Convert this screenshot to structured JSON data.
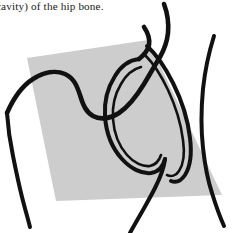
{
  "figure": {
    "caption_fragment": "cavity) of the hip bone."
  },
  "colors": {
    "background": "#ffffff",
    "plane_fill": "#cdcdcd",
    "ink": "#111111",
    "caption_text": "#1a1a1a"
  },
  "plane": {
    "name": "sectional-plane-parallelogram",
    "points": "27,58 148,40 222,195 56,201"
  },
  "strokes": {
    "iliac_crest": {
      "name": "iliac-crest-outline",
      "d": "M 7,113 C 14,97 22,86 33,79 C 44,72 56,70 65,74 C 74,78 77,86 80,95 C 83,105 86,112 93,116 C 100,120 110,119 119,113 C 128,107 136,97 144,84 C 150,74 155,65 160,57 C 164,50 167,42 168,33 C 169,22 167,12 164,4",
      "width": 4.6
    },
    "ischium_lower": {
      "name": "ischium-inferior-ramus",
      "d": "M 7,113 C 8,128 10,142 13,156 C 16,171 19,185 22,197 C 25,209 28,219 30,227",
      "width": 4.0
    },
    "acetabulum_outer": {
      "name": "acetabulum-outer-rim",
      "d": "M 139,59 C 130,60 121,66 115,76 C 108,87 104,101 105,116 C 106,132 112,148 122,159 C 131,169 142,174 151,173 C 158,172 163,167 165,159",
      "width": 4.0
    },
    "acetabulum_inner": {
      "name": "acetabulum-inner-rim",
      "d": "M 141,67 C 133,69 126,75 121,84 C 115,94 112,106 113,119 C 114,133 119,146 127,155 C 134,163 143,167 150,166 C 155,165 159,161 161,155",
      "width": 2.6
    },
    "acetabular_notch_band_outer": {
      "name": "acetabular-notch-band-outer",
      "d": "M 147,46 C 156,54 165,67 173,83 C 182,101 188,120 190,138 C 192,154 190,167 185,175 C 181,181 176,183 171,181",
      "width": 4.0
    },
    "acetabular_notch_band_inner": {
      "name": "acetabular-notch-band-inner",
      "d": "M 145,55 C 153,63 161,75 168,90 C 176,107 181,124 183,140 C 185,154 183,165 179,171 C 176,176 171,177 167,175",
      "width": 2.6
    },
    "superior_ramus_hook": {
      "name": "superior-ramus-hook",
      "d": "M 139,59 C 144,55 148,50 149,45 C 150,39 148,33 144,27",
      "width": 4.6
    },
    "femur_shaft": {
      "name": "femoral-shaft-outline",
      "d": "M 214,36 C 209,52 205,70 203,89 C 201,110 201,130 203,148 C 205,166 208,181 212,193 C 216,206 220,217 224,226",
      "width": 4.0
    },
    "ilium_lateral_edge": {
      "name": "ilium-lateral-edge",
      "d": "M 165,159 C 164,168 160,178 155,188 C 150,198 144,208 139,217 C 135,224 132,229 130,233",
      "width": 4.0
    }
  }
}
